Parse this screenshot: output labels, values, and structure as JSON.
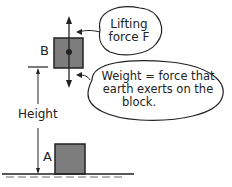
{
  "diagram": {
    "labels": {
      "block_b": "B",
      "block_a": "A",
      "height": "Height"
    },
    "callouts": {
      "lifting_force": [
        "Lifting",
        "force F"
      ],
      "weight": [
        "Weight = force that",
        "earth exerts on the",
        "block."
      ]
    },
    "colors": {
      "block_fill": "#7d7d7d",
      "line": "#222222",
      "background": "#ffffff"
    }
  }
}
